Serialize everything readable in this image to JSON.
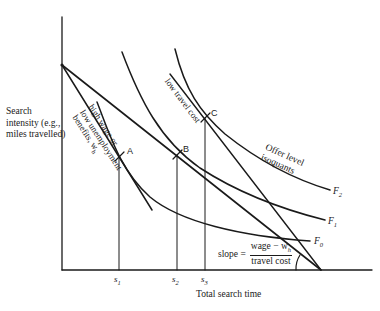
{
  "diagram": {
    "axes": {
      "y_label": "Search intensity (e.g., miles travelled)",
      "x_label": "Total search time"
    },
    "x_ticks": [
      {
        "name": "s1",
        "base": "s",
        "sub": "1"
      },
      {
        "name": "s2",
        "base": "s",
        "sub": "2"
      },
      {
        "name": "s3",
        "base": "s",
        "sub": "3"
      }
    ],
    "points": [
      {
        "label": "A"
      },
      {
        "label": "B"
      },
      {
        "label": "C"
      }
    ],
    "isoquants": {
      "group_label_line1": "Offer level",
      "group_label_line2": "isoquants",
      "items": [
        {
          "base": "F",
          "sub": "2"
        },
        {
          "base": "F",
          "sub": "1"
        },
        {
          "base": "F",
          "sub": "0"
        }
      ]
    },
    "budget_lines": {
      "high_wage_label_line1": "high wage or",
      "high_wage_label_line2": "low unemployment",
      "high_wage_label_line3": "benefits, w",
      "high_wage_label_sub": "h",
      "low_travel_label": "low travel cost"
    },
    "slope_annotation": {
      "prefix": "slope =",
      "numerator": "wage − w",
      "numerator_sub": "h",
      "denominator": "travel cost"
    },
    "colors": {
      "ink": "#1a1a1a",
      "background": "#ffffff"
    }
  }
}
